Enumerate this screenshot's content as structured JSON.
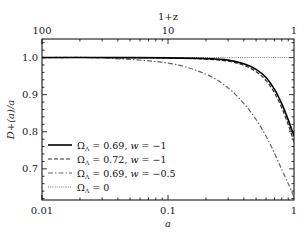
{
  "chart_data": {
    "type": "line",
    "title": "",
    "xlabel": "a",
    "ylabel": "D+(a)/a",
    "top_xlabel": "1+z",
    "xscale": "log",
    "xlim": [
      0.01,
      1
    ],
    "ylim": [
      0.616,
      1.05
    ],
    "xticks": [
      {
        "value": 0.01,
        "label": "0.01"
      },
      {
        "value": 0.1,
        "label": "0.1"
      },
      {
        "value": 1,
        "label": "1"
      }
    ],
    "top_xticks": [
      {
        "value": 0.01,
        "label": "100"
      },
      {
        "value": 0.1,
        "label": "10"
      },
      {
        "value": 1,
        "label": "1"
      }
    ],
    "yticks": [
      {
        "value": 1.0,
        "label": "1.0"
      },
      {
        "value": 0.9,
        "label": "0.9"
      },
      {
        "value": 0.8,
        "label": "0.8"
      },
      {
        "value": 0.7,
        "label": "0.7"
      }
    ],
    "grid": false,
    "legend_position": "lower left",
    "x": [
      0.01,
      0.03,
      0.1,
      0.2,
      0.3,
      0.4,
      0.5,
      0.6,
      0.7,
      0.8,
      0.9,
      1.0
    ],
    "series": [
      {
        "name": "ΩΛ=0.69, w=−1",
        "style": "solid",
        "color": "#000000",
        "values": [
          1.0,
          1.0,
          0.999,
          0.997,
          0.993,
          0.983,
          0.968,
          0.946,
          0.914,
          0.875,
          0.832,
          0.788
        ]
      },
      {
        "name": "ΩΛ=0.72, w=−1",
        "style": "dashed",
        "color": "#333333",
        "values": [
          1.0,
          1.0,
          0.999,
          0.996,
          0.99,
          0.979,
          0.962,
          0.938,
          0.905,
          0.864,
          0.819,
          0.772
        ]
      },
      {
        "name": "ΩΛ=0.69, w=−0.5",
        "style": "dashdot",
        "color": "#666666",
        "values": [
          1.0,
          0.999,
          0.985,
          0.955,
          0.918,
          0.876,
          0.833,
          0.788,
          0.742,
          0.698,
          0.66,
          0.625
        ]
      },
      {
        "name": "ΩΛ=0",
        "style": "dotted",
        "color": "#555555",
        "values": [
          1.0,
          1.0,
          1.0,
          1.0,
          1.0,
          1.0,
          1.0,
          1.0,
          1.0,
          1.0,
          1.0,
          1.0
        ]
      }
    ]
  },
  "legend": {
    "items": [
      {
        "label": "ΩΛ = 0.69, w = −1",
        "omega": "0.69",
        "w": "−1"
      },
      {
        "label": "ΩΛ = 0.72, w = −1",
        "omega": "0.72",
        "w": "−1"
      },
      {
        "label": "ΩΛ = 0.69, w = −0.5",
        "omega": "0.69",
        "w": "−0.5"
      },
      {
        "label": "ΩΛ = 0",
        "omega": "0",
        "w": ""
      }
    ]
  }
}
